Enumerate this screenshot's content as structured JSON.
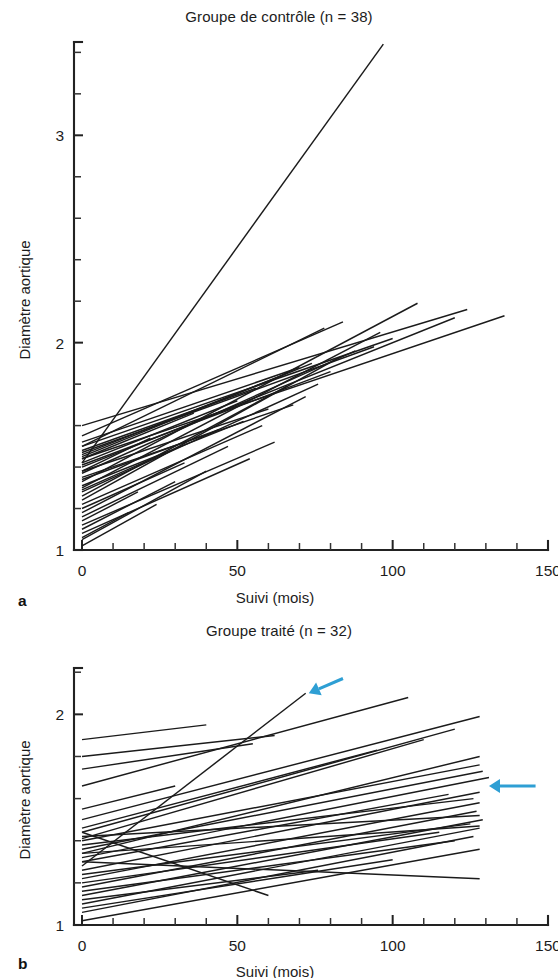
{
  "figure": {
    "panel_a_letter": "a",
    "panel_b_letter": "b"
  },
  "chart_data": [
    {
      "id": "panel-a",
      "type": "line",
      "title": "Groupe de contrôle (n = 38)",
      "xlabel": "Suivi (mois)",
      "ylabel": "Diamètre aortique",
      "xlim": [
        0,
        150
      ],
      "ylim": [
        1,
        3.45
      ],
      "xticks": [
        0,
        50,
        100,
        150
      ],
      "xtick_labels": [
        "0",
        "50",
        "100",
        "150"
      ],
      "xminor_step": 10,
      "yticks": [
        1,
        2,
        3
      ],
      "ytick_labels": [
        "1",
        "2",
        "3"
      ],
      "yminor_step": 0.2,
      "grid": false,
      "legend": "none",
      "n": 38,
      "series_note": "Chaque trait relie le diamètre aortique initial au diamètre final d'un patient",
      "series": [
        {
          "name": "p1",
          "x": [
            0,
            97
          ],
          "y": [
            1.42,
            3.44
          ]
        },
        {
          "name": "p2",
          "x": [
            0,
            124
          ],
          "y": [
            1.6,
            2.16
          ]
        },
        {
          "name": "p3",
          "x": [
            0,
            136
          ],
          "y": [
            1.44,
            2.13
          ]
        },
        {
          "name": "p4",
          "x": [
            0,
            120
          ],
          "y": [
            1.4,
            2.12
          ]
        },
        {
          "name": "p5",
          "x": [
            0,
            108
          ],
          "y": [
            1.33,
            2.19
          ]
        },
        {
          "name": "p6",
          "x": [
            0,
            100
          ],
          "y": [
            1.5,
            2.02
          ]
        },
        {
          "name": "p7",
          "x": [
            0,
            96
          ],
          "y": [
            1.3,
            2.05
          ]
        },
        {
          "name": "p8",
          "x": [
            0,
            94
          ],
          "y": [
            1.47,
            1.98
          ]
        },
        {
          "name": "p9",
          "x": [
            0,
            88
          ],
          "y": [
            1.37,
            1.96
          ]
        },
        {
          "name": "p10",
          "x": [
            0,
            84
          ],
          "y": [
            1.55,
            2.1
          ]
        },
        {
          "name": "p11",
          "x": [
            0,
            83
          ],
          "y": [
            1.24,
            1.93
          ]
        },
        {
          "name": "p12",
          "x": [
            0,
            80
          ],
          "y": [
            1.41,
            1.86
          ]
        },
        {
          "name": "p13",
          "x": [
            0,
            78
          ],
          "y": [
            1.5,
            2.07
          ]
        },
        {
          "name": "p14",
          "x": [
            0,
            76
          ],
          "y": [
            1.28,
            1.8
          ]
        },
        {
          "name": "p15",
          "x": [
            0,
            74
          ],
          "y": [
            1.45,
            1.9
          ]
        },
        {
          "name": "p16",
          "x": [
            0,
            72
          ],
          "y": [
            1.18,
            1.74
          ]
        },
        {
          "name": "p17",
          "x": [
            0,
            70
          ],
          "y": [
            1.52,
            1.88
          ]
        },
        {
          "name": "p18",
          "x": [
            0,
            68
          ],
          "y": [
            1.35,
            1.7
          ]
        },
        {
          "name": "p19",
          "x": [
            0,
            66
          ],
          "y": [
            1.26,
            1.79
          ]
        },
        {
          "name": "p20",
          "x": [
            0,
            64
          ],
          "y": [
            1.46,
            1.84
          ]
        },
        {
          "name": "p21",
          "x": [
            0,
            62
          ],
          "y": [
            1.12,
            1.52
          ]
        },
        {
          "name": "p22",
          "x": [
            0,
            60
          ],
          "y": [
            1.38,
            1.68
          ]
        },
        {
          "name": "p23",
          "x": [
            0,
            58
          ],
          "y": [
            1.22,
            1.6
          ]
        },
        {
          "name": "p24",
          "x": [
            0,
            56
          ],
          "y": [
            1.48,
            1.78
          ]
        },
        {
          "name": "p25",
          "x": [
            0,
            54
          ],
          "y": [
            1.08,
            1.44
          ]
        },
        {
          "name": "p26",
          "x": [
            0,
            52
          ],
          "y": [
            1.31,
            1.62
          ]
        },
        {
          "name": "p27",
          "x": [
            0,
            50
          ],
          "y": [
            1.42,
            1.72
          ]
        },
        {
          "name": "p28",
          "x": [
            0,
            47
          ],
          "y": [
            1.16,
            1.5
          ]
        },
        {
          "name": "p29",
          "x": [
            0,
            44
          ],
          "y": [
            1.34,
            1.58
          ]
        },
        {
          "name": "p30",
          "x": [
            0,
            40
          ],
          "y": [
            1.05,
            1.38
          ]
        },
        {
          "name": "p31",
          "x": [
            0,
            36
          ],
          "y": [
            1.44,
            1.66
          ]
        },
        {
          "name": "p32",
          "x": [
            0,
            33
          ],
          "y": [
            1.2,
            1.42
          ]
        },
        {
          "name": "p33",
          "x": [
            0,
            30
          ],
          "y": [
            1.1,
            1.33
          ]
        },
        {
          "name": "p34",
          "x": [
            0,
            27
          ],
          "y": [
            1.29,
            1.47
          ]
        },
        {
          "name": "p35",
          "x": [
            0,
            24
          ],
          "y": [
            1.02,
            1.22
          ]
        },
        {
          "name": "p36",
          "x": [
            0,
            22
          ],
          "y": [
            1.38,
            1.54
          ]
        },
        {
          "name": "p37",
          "x": [
            0,
            18
          ],
          "y": [
            1.14,
            1.28
          ]
        },
        {
          "name": "p38",
          "x": [
            0,
            15
          ],
          "y": [
            1.06,
            1.18
          ]
        }
      ]
    },
    {
      "id": "panel-b",
      "type": "line",
      "title": "Groupe traité (n = 32)",
      "xlabel": "Suivi (mois)",
      "ylabel": "Diamètre aortique",
      "xlim": [
        0,
        150
      ],
      "ylim": [
        1,
        2.22
      ],
      "xticks": [
        0,
        50,
        100,
        150
      ],
      "xtick_labels": [
        "0",
        "50",
        "100",
        "150"
      ],
      "xminor_step": 10,
      "yticks": [
        1,
        2
      ],
      "ytick_labels": [
        "1",
        "2"
      ],
      "yminor_step": 0.2,
      "grid": false,
      "legend": "none",
      "n": 32,
      "series_note": "Les flèches bleues signalent deux évolutions rapides",
      "series": [
        {
          "name": "t1",
          "x": [
            0,
            72
          ],
          "y": [
            1.28,
            2.1
          ]
        },
        {
          "name": "t2",
          "x": [
            0,
            105
          ],
          "y": [
            1.66,
            2.08
          ]
        },
        {
          "name": "t3",
          "x": [
            0,
            128
          ],
          "y": [
            1.5,
            1.99
          ]
        },
        {
          "name": "t4",
          "x": [
            0,
            120
          ],
          "y": [
            1.44,
            1.93
          ]
        },
        {
          "name": "t5",
          "x": [
            0,
            110
          ],
          "y": [
            1.41,
            1.88
          ]
        },
        {
          "name": "t6",
          "x": [
            0,
            128
          ],
          "y": [
            1.34,
            1.8
          ]
        },
        {
          "name": "t7",
          "x": [
            0,
            95
          ],
          "y": [
            1.46,
            1.83
          ]
        },
        {
          "name": "t8",
          "x": [
            0,
            128
          ],
          "y": [
            1.4,
            1.76
          ]
        },
        {
          "name": "t9",
          "x": [
            0,
            129
          ],
          "y": [
            1.36,
            1.73
          ]
        },
        {
          "name": "t10",
          "x": [
            0,
            131
          ],
          "y": [
            1.32,
            1.7
          ]
        },
        {
          "name": "t11",
          "x": [
            0,
            40
          ],
          "y": [
            1.88,
            1.95
          ]
        },
        {
          "name": "t12",
          "x": [
            0,
            62
          ],
          "y": [
            1.8,
            1.9
          ]
        },
        {
          "name": "t13",
          "x": [
            0,
            55
          ],
          "y": [
            1.74,
            1.86
          ]
        },
        {
          "name": "t14",
          "x": [
            0,
            128
          ],
          "y": [
            1.26,
            1.63
          ]
        },
        {
          "name": "t15",
          "x": [
            0,
            118
          ],
          "y": [
            1.3,
            1.62
          ]
        },
        {
          "name": "t16",
          "x": [
            0,
            128
          ],
          "y": [
            1.22,
            1.58
          ]
        },
        {
          "name": "t17",
          "x": [
            0,
            126
          ],
          "y": [
            1.38,
            1.6
          ]
        },
        {
          "name": "t18",
          "x": [
            0,
            127
          ],
          "y": [
            1.18,
            1.54
          ]
        },
        {
          "name": "t19",
          "x": [
            0,
            30
          ],
          "y": [
            1.55,
            1.66
          ]
        },
        {
          "name": "t20",
          "x": [
            0,
            128
          ],
          "y": [
            1.42,
            1.52
          ]
        },
        {
          "name": "t21",
          "x": [
            0,
            129
          ],
          "y": [
            1.14,
            1.5
          ]
        },
        {
          "name": "t22",
          "x": [
            0,
            125
          ],
          "y": [
            1.24,
            1.48
          ]
        },
        {
          "name": "t23",
          "x": [
            0,
            128
          ],
          "y": [
            1.1,
            1.46
          ]
        },
        {
          "name": "t24",
          "x": [
            0,
            128
          ],
          "y": [
            1.34,
            1.47
          ]
        },
        {
          "name": "t25",
          "x": [
            0,
            126
          ],
          "y": [
            1.06,
            1.42
          ]
        },
        {
          "name": "t26",
          "x": [
            0,
            120
          ],
          "y": [
            1.16,
            1.4
          ]
        },
        {
          "name": "t27",
          "x": [
            0,
            128
          ],
          "y": [
            1.02,
            1.36
          ]
        },
        {
          "name": "t28",
          "x": [
            0,
            76
          ],
          "y": [
            1.12,
            1.26
          ]
        },
        {
          "name": "t29",
          "x": [
            0,
            128
          ],
          "y": [
            1.3,
            1.22
          ]
        },
        {
          "name": "t30",
          "x": [
            0,
            60
          ],
          "y": [
            1.44,
            1.14
          ]
        },
        {
          "name": "t31",
          "x": [
            0,
            115
          ],
          "y": [
            1.2,
            1.44
          ]
        },
        {
          "name": "t32",
          "x": [
            0,
            100
          ],
          "y": [
            1.08,
            1.31
          ]
        }
      ],
      "annotations": [
        {
          "name": "arrow-fast-riser",
          "color": "#2E9FD4",
          "tail_x": 84,
          "tail_y": 2.17,
          "head_x": 73,
          "head_y": 2.1
        },
        {
          "name": "arrow-plateau-group",
          "color": "#2E9FD4",
          "tail_x": 146,
          "tail_y": 1.66,
          "head_x": 131,
          "head_y": 1.66
        }
      ]
    }
  ]
}
